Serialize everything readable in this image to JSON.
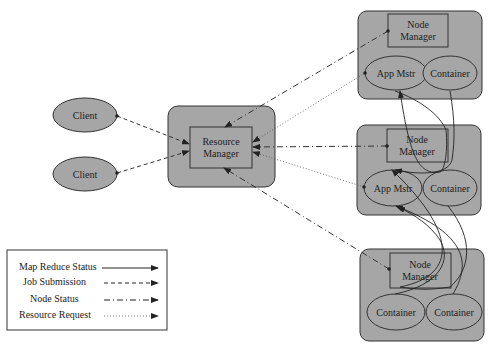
{
  "colors": {
    "node_fill": "#a6a6a6",
    "stroke": "#333333",
    "background": "#ffffff"
  },
  "clients": [
    {
      "label": "Client"
    },
    {
      "label": "Client"
    }
  ],
  "resource_manager": {
    "label_line1": "Resource",
    "label_line2": "Manager"
  },
  "nodes": [
    {
      "manager": {
        "label_line1": "Node",
        "label_line2": "Manager"
      },
      "left": {
        "label": "App Mstr"
      },
      "right": {
        "label": "Container"
      }
    },
    {
      "manager": {
        "label_line1": "Node",
        "label_line2": "Manager"
      },
      "left": {
        "label": "App Mstr"
      },
      "right": {
        "label": "Container"
      }
    },
    {
      "manager": {
        "label_line1": "Node",
        "label_line2": "Manager"
      },
      "left": {
        "label": "Container"
      },
      "right": {
        "label": "Container"
      }
    }
  ],
  "legend": {
    "items": [
      {
        "label": "Map Reduce Status",
        "style": "solid"
      },
      {
        "label": "Job Submission",
        "style": "dashed"
      },
      {
        "label": "Node Status",
        "style": "dash-dot"
      },
      {
        "label": "Resource Request",
        "style": "dotted"
      }
    ]
  }
}
